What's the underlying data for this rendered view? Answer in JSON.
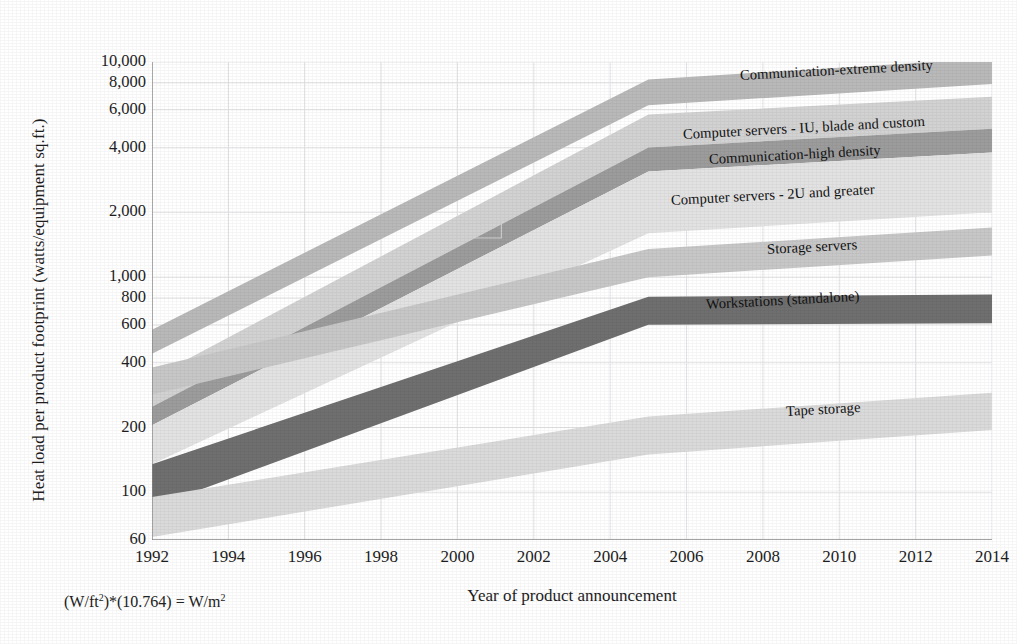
{
  "chart_data": {
    "type": "area",
    "title": "",
    "subtitle": "",
    "xlabel": "Year of product announcement",
    "ylabel": "Heat load per product footprint (watts/equipment sq.ft.)",
    "footnote": "(W/ft2)*(10.764) = W/m2",
    "footnote_parts": {
      "p1": "(W/ft",
      "sup1": "2",
      "p2": ")*(10.764) = W/m",
      "sup2": "2"
    },
    "yscale": "log",
    "ylim": [
      60,
      10000
    ],
    "xlim": [
      1992,
      2014
    ],
    "grid": true,
    "legend": "inline-band-labels",
    "xticks": [
      "1992",
      "1994",
      "1996",
      "1998",
      "2000",
      "2002",
      "2004",
      "2006",
      "2008",
      "2010",
      "2012",
      "2014"
    ],
    "xtick_values": [
      1992,
      1994,
      1996,
      1998,
      2000,
      2002,
      2004,
      2006,
      2008,
      2010,
      2012,
      2014
    ],
    "yticks": [
      "60",
      "100",
      "200",
      "400",
      "600",
      "800",
      "1,000",
      "2,000",
      "4,000",
      "6,000",
      "8,000",
      "10,000"
    ],
    "ytick_values": [
      60,
      100,
      200,
      400,
      600,
      800,
      1000,
      2000,
      4000,
      6000,
      8000,
      10000
    ],
    "x_breakpoints": [
      1992,
      2005,
      2014
    ],
    "series": [
      {
        "name": "Communication-extreme density",
        "label": "Communication-extreme density",
        "color": "#b9b9b9",
        "upper": [
          570,
          8300,
          10400
        ],
        "lower": [
          440,
          6300,
          7900
        ],
        "label_x": 2007.4,
        "label_y": 8600
      },
      {
        "name": "Computer servers - IU, blade and custom",
        "label": "Computer servers - IU, blade and custom",
        "color": "#d2d2d2",
        "upper": [
          340,
          5700,
          6900
        ],
        "lower": [
          250,
          4000,
          4900
        ],
        "label_x": 2005.9,
        "label_y": 4600
      },
      {
        "name": "Communication-high density",
        "label": "Communication-high density",
        "color": "#9c9c9c",
        "upper": [
          250,
          4000,
          4900
        ],
        "lower": [
          205,
          3100,
          3800
        ],
        "label_x": 2006.6,
        "label_y": 3500
      },
      {
        "name": "Computer servers - 2U and greater",
        "label": "Computer servers - 2U and greater",
        "color": "#e2e2e2",
        "upper": [
          205,
          3100,
          3800
        ],
        "lower": [
          135,
          1600,
          2000
        ],
        "label_x": 2005.6,
        "label_y": 2250
      },
      {
        "name": "Storage servers",
        "label": "Storage servers",
        "color": "#c7c7c7",
        "upper": [
          380,
          1350,
          1700
        ],
        "lower": [
          285,
          1000,
          1260
        ],
        "label_x": 2008.1,
        "label_y": 1330
      },
      {
        "name": "Workstations (standalone)",
        "label": "Workstations (standalone)",
        "color": "#6f6f6f",
        "upper": [
          135,
          810,
          830
        ],
        "lower": [
          85,
          600,
          610
        ],
        "label_x": 2006.5,
        "label_y": 740
      },
      {
        "name": "Tape storage",
        "label": "Tape storage",
        "color": "#dadada",
        "upper": [
          95,
          225,
          290
        ],
        "lower": [
          62,
          150,
          195
        ],
        "label_x": 2008.6,
        "label_y": 235
      }
    ]
  },
  "page": {
    "background": "#ffffff",
    "axis_color": "#8a8a8a",
    "grid_color": "#e3e3e6",
    "text_color": "#1d1d1d"
  }
}
